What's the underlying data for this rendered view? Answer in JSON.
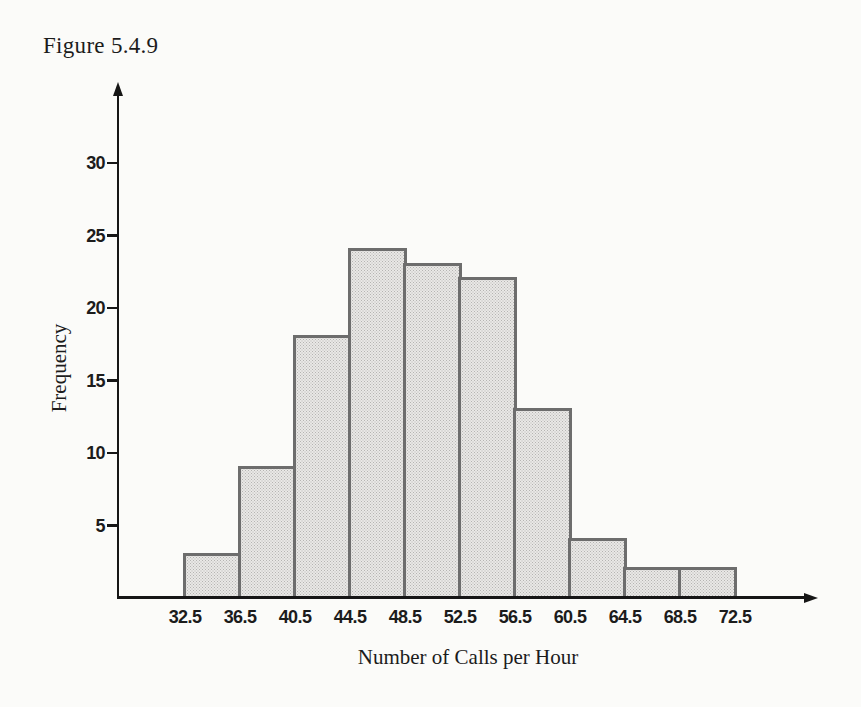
{
  "figure_label": "Figure 5.4.9",
  "chart_data": {
    "type": "bar",
    "subtype": "histogram",
    "title": "Figure 5.4.9",
    "xlabel": "Number of Calls per Hour",
    "ylabel": "Frequency",
    "bin_edges": [
      32.5,
      36.5,
      40.5,
      44.5,
      48.5,
      52.5,
      56.5,
      60.5,
      64.5,
      68.5,
      72.5
    ],
    "x_tick_labels": [
      "32.5",
      "36.5",
      "40.5",
      "44.5",
      "48.5",
      "52.5",
      "56.5",
      "60.5",
      "64.5",
      "68.5",
      "72.5"
    ],
    "frequencies": [
      3,
      9,
      18,
      24,
      23,
      22,
      13,
      4,
      2,
      2
    ],
    "y_ticks": [
      5,
      10,
      15,
      20,
      25,
      30
    ],
    "ylim": [
      0,
      32
    ],
    "xlim": [
      32.5,
      72.5
    ],
    "grid": false,
    "legend_position": "none",
    "colors": {
      "bar_fill": "#e9e8e6",
      "bar_dot": "#b5b4b2",
      "bar_border": "#6d6d6d",
      "axis": "#161616",
      "text": "#1c1c1c",
      "background": "#fbfbf9"
    }
  }
}
